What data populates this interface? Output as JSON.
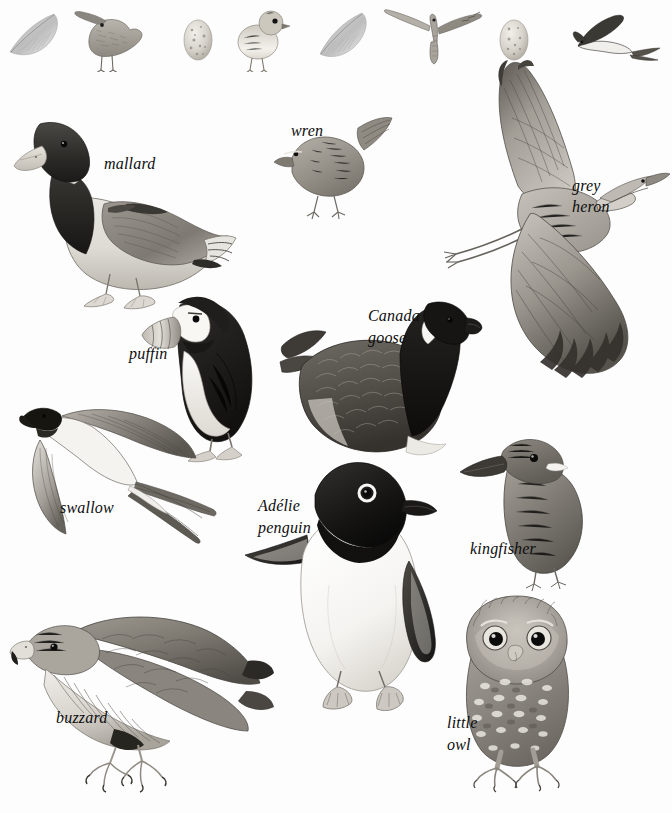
{
  "plate": {
    "title": "Birds",
    "medium": "grayscale natural-history illustration plate",
    "background_color": "#fdfdfd",
    "ink_color": "#0d0d0d",
    "width": 672,
    "height": 813
  },
  "top_row": {
    "description": "decorative strip of feathers, eggs, a chick and small birds",
    "items": [
      {
        "name": "feather",
        "label": ""
      },
      {
        "name": "curlew",
        "label": ""
      },
      {
        "name": "speckled-egg",
        "label": ""
      },
      {
        "name": "chick",
        "label": ""
      },
      {
        "name": "feather",
        "label": ""
      },
      {
        "name": "kestrel-in-flight",
        "label": ""
      },
      {
        "name": "speckled-egg",
        "label": ""
      },
      {
        "name": "swallow-small",
        "label": ""
      }
    ]
  },
  "figures": [
    {
      "id": "mallard",
      "label": "mallard",
      "label_lines": [
        "mallard"
      ],
      "label_x": 104,
      "label_y": 153,
      "pose": "standing, side view, dark head with white neck ring"
    },
    {
      "id": "wren",
      "label": "wren",
      "label_lines": [
        "wren"
      ],
      "label_x": 291,
      "label_y": 120,
      "pose": "perched, cocked tail"
    },
    {
      "id": "grey-heron",
      "label": "grey heron",
      "label_lines": [
        "grey",
        "heron"
      ],
      "label_x": 572,
      "label_y": 175,
      "pose": "in flight, wings spread, legs trailing"
    },
    {
      "id": "puffin",
      "label": "puffin",
      "label_lines": [
        "puffin"
      ],
      "label_x": 129,
      "label_y": 343,
      "pose": "standing, side view, striped bill"
    },
    {
      "id": "canada-goose",
      "label": "Canada goose",
      "label_lines": [
        "Canada",
        "goose"
      ],
      "label_x": 368,
      "label_y": 305,
      "pose": "swimming, black neck with white chinstrap"
    },
    {
      "id": "swallow",
      "label": "swallow",
      "label_lines": [
        "swallow"
      ],
      "label_x": 60,
      "label_y": 497,
      "pose": "in flight, long forked tail streamers"
    },
    {
      "id": "adelie-penguin",
      "label": "Adélie penguin",
      "label_lines": [
        "Adélie",
        "penguin"
      ],
      "label_x": 258,
      "label_y": 495,
      "pose": "standing, front view, white eye-ring"
    },
    {
      "id": "kingfisher",
      "label": "kingfisher",
      "label_lines": [
        "kingfisher"
      ],
      "label_x": 470,
      "label_y": 538,
      "pose": "perched, long dagger bill"
    },
    {
      "id": "buzzard",
      "label": "buzzard",
      "label_lines": [
        "buzzard"
      ],
      "label_x": 56,
      "label_y": 707,
      "pose": "perched, side view, hooked bill"
    },
    {
      "id": "little-owl",
      "label": "little owl",
      "label_lines": [
        "little",
        "owl"
      ],
      "label_x": 447,
      "label_y": 712,
      "pose": "standing, front view, large eyes"
    }
  ]
}
